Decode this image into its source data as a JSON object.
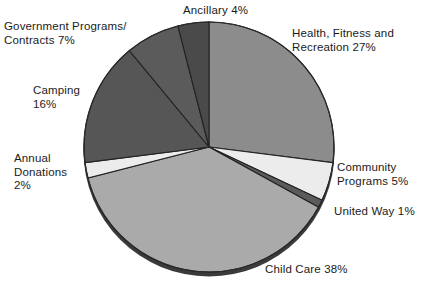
{
  "chart_data": {
    "type": "pie",
    "title": "",
    "subtitle": "",
    "xlabel": "",
    "ylabel": "",
    "legend_position": "none",
    "grid": false,
    "total": 100,
    "units": "percent",
    "start_angle_deg": 0,
    "direction": "clockwise",
    "categories": [
      "Health, Fitness and Recreation",
      "Community Programs",
      "United Way",
      "Child Care",
      "Annual Donations",
      "Camping",
      "Government Programs/Contracts",
      "Ancillary"
    ],
    "values": [
      27,
      5,
      1,
      38,
      2,
      16,
      7,
      4
    ],
    "slices": [
      {
        "name": "Health, Fitness and Recreation",
        "value": 27,
        "label": "Health, Fitness and\nRecreation 27%",
        "color": "#8c8c8c"
      },
      {
        "name": "Community Programs",
        "value": 5,
        "label": "Community\nPrograms 5%",
        "color": "#ececec"
      },
      {
        "name": "United Way",
        "value": 1,
        "label": "United Way 1%",
        "color": "#5b5b5b"
      },
      {
        "name": "Child Care",
        "value": 38,
        "label": "Child Care 38%",
        "color": "#aaaaaa"
      },
      {
        "name": "Annual Donations",
        "value": 2,
        "label": "Annual\nDonations\n2%",
        "color": "#ececec"
      },
      {
        "name": "Camping",
        "value": 16,
        "label": "Camping\n16%",
        "color": "#565656"
      },
      {
        "name": "Government Programs/Contracts",
        "value": 7,
        "label": "Government Programs/\nContracts 7%",
        "color": "#5b5b5b"
      },
      {
        "name": "Ancillary",
        "value": 4,
        "label": "Ancillary 4%",
        "color": "#4a4a4a"
      }
    ]
  },
  "labels": {
    "health": "Health, Fitness and\nRecreation 27%",
    "community": "Community\nPrograms 5%",
    "united_way": "United Way 1%",
    "child_care": "Child Care 38%",
    "annual_donations": "Annual\nDonations\n2%",
    "camping": "Camping\n16%",
    "government": "Government Programs/\nContracts 7%",
    "ancillary": "Ancillary 4%"
  }
}
